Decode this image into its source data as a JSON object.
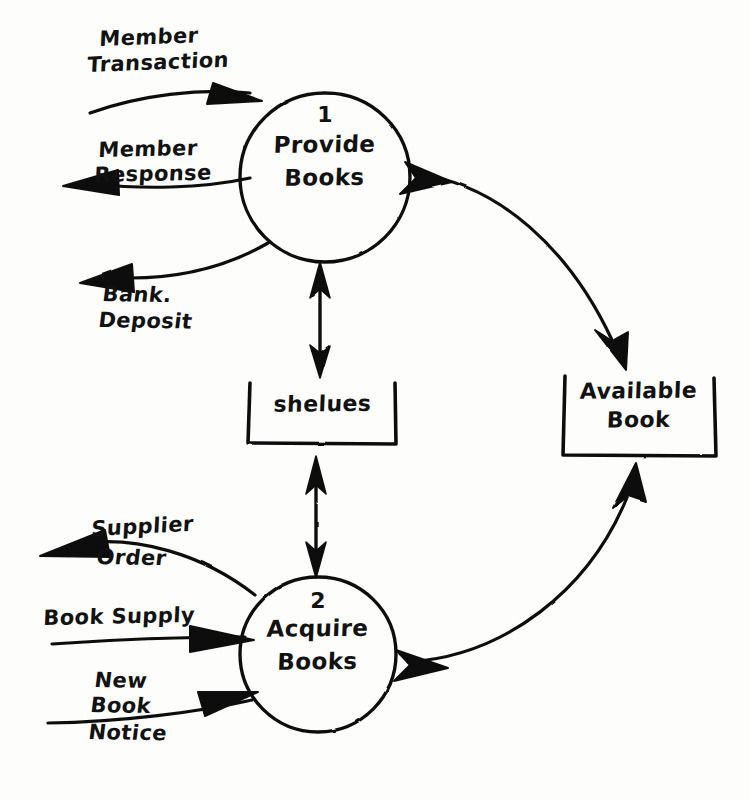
{
  "diagram": {
    "style": "hand-drawn",
    "ink_color": "#101010",
    "paper_color": "#fdfdfc"
  },
  "processes": [
    {
      "id": "p1",
      "number": "1",
      "name_line1": "Provide",
      "name_line2": "Books",
      "shape": "circle",
      "cx": 325,
      "cy": 177,
      "r": 85
    },
    {
      "id": "p2",
      "number": "2",
      "name_line1": "Acquire",
      "name_line2": "Books",
      "shape": "circle",
      "cx": 318,
      "cy": 654,
      "r": 78
    }
  ],
  "data_stores": [
    {
      "id": "d1",
      "name_line1": "shelues",
      "name_line2": "",
      "shape": "open-rect",
      "x": 248,
      "y": 381,
      "w": 148,
      "h": 63
    },
    {
      "id": "d2",
      "name_line1": "Available",
      "name_line2": "Book",
      "shape": "open-rect",
      "x": 563,
      "y": 374,
      "w": 152,
      "h": 82
    }
  ],
  "flows": [
    {
      "id": "f1",
      "label_line1": "Member",
      "label_line2": "Transaction",
      "direction": "into-process-1",
      "arrow": "single",
      "from": "external",
      "to": "p1"
    },
    {
      "id": "f2",
      "label_line1": "Member",
      "label_line2": "Response",
      "direction": "out-of-process-1",
      "arrow": "single",
      "from": "p1",
      "to": "external"
    },
    {
      "id": "f3",
      "label_line1": "Bank.",
      "label_line2": "Deposit",
      "direction": "out-of-process-1",
      "arrow": "single",
      "from": "p1",
      "to": "external"
    },
    {
      "id": "f4",
      "label_line1": "",
      "label_line2": "",
      "direction": "bidirectional",
      "arrow": "double",
      "from": "p1",
      "to": "d1"
    },
    {
      "id": "f5",
      "label_line1": "",
      "label_line2": "",
      "direction": "bidirectional",
      "arrow": "double",
      "from": "d1",
      "to": "p2"
    },
    {
      "id": "f6",
      "label_line1": "",
      "label_line2": "",
      "direction": "bidirectional",
      "arrow": "double",
      "from": "p1",
      "to": "d2"
    },
    {
      "id": "f7",
      "label_line1": "",
      "label_line2": "",
      "direction": "bidirectional",
      "arrow": "double",
      "from": "p2",
      "to": "d2"
    },
    {
      "id": "f8",
      "label_line1": "Supplier",
      "label_line2": "Order",
      "direction": "out-of-process-2",
      "arrow": "single",
      "from": "p2",
      "to": "external"
    },
    {
      "id": "f9",
      "label_line1": "Book Supply",
      "label_line2": "",
      "direction": "into-process-2",
      "arrow": "single",
      "from": "external",
      "to": "p2"
    },
    {
      "id": "f10",
      "label_line1": "New",
      "label_line2": "Book",
      "label_line3": "Notice",
      "direction": "into-process-2",
      "arrow": "single",
      "from": "external",
      "to": "p2"
    }
  ]
}
